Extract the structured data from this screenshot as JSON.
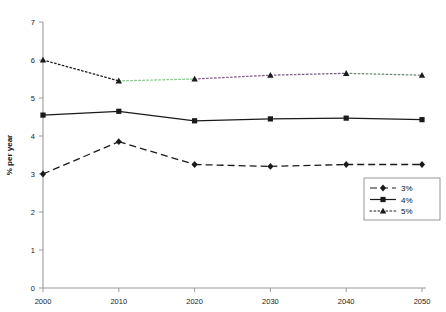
{
  "chart_data": {
    "type": "line",
    "title": "",
    "xlabel": "",
    "ylabel": "% per year",
    "x": [
      2000,
      2010,
      2020,
      2030,
      2040,
      2050
    ],
    "categories": [
      "2000",
      "2010",
      "2020",
      "2030",
      "2040",
      "2050"
    ],
    "xlim": [
      2000,
      2050
    ],
    "ylim": [
      0,
      7
    ],
    "yticks": [
      0,
      1,
      2,
      3,
      4,
      5,
      6,
      7
    ],
    "ytick_labels": [
      "0",
      "1",
      "2",
      "3",
      "4",
      "5",
      "6",
      "7"
    ],
    "xtick_labels": [
      "2000",
      "2010",
      "2020",
      "2030",
      "2040",
      "2050"
    ],
    "grid": false,
    "legend_position": "bottom-right",
    "series": [
      {
        "name": "3%",
        "values": [
          3.0,
          3.85,
          3.25,
          3.2,
          3.25,
          3.25
        ],
        "style": "dashed",
        "marker": "diamond",
        "color": "#1a1a1a"
      },
      {
        "name": "4%",
        "values": [
          4.55,
          4.65,
          4.4,
          4.45,
          4.47,
          4.43
        ],
        "style": "solid",
        "marker": "square",
        "color": "#1a1a1a"
      },
      {
        "name": "5%",
        "values": [
          6.0,
          5.45,
          5.5,
          5.6,
          5.65,
          5.6
        ],
        "style": "dotted",
        "marker": "triangle",
        "color": "#1a1a1a",
        "segment_tints": [
          "#1a1a1a",
          "#86c98a",
          "#8d5f8e",
          "#7a5f86",
          "#6f8f78"
        ]
      }
    ]
  },
  "legend": {
    "items": [
      {
        "label": "3%",
        "style": "dashed",
        "marker": "diamond"
      },
      {
        "label": "4%",
        "style": "solid",
        "marker": "square"
      },
      {
        "label": "5%",
        "style": "dotted",
        "marker": "triangle"
      }
    ]
  },
  "colors": {
    "axis": "#9a9a9a",
    "ink": "#1a1a1a",
    "background": "#ffffff",
    "green_tint": "#86c98a",
    "purple_tint": "#8d5f8e"
  }
}
